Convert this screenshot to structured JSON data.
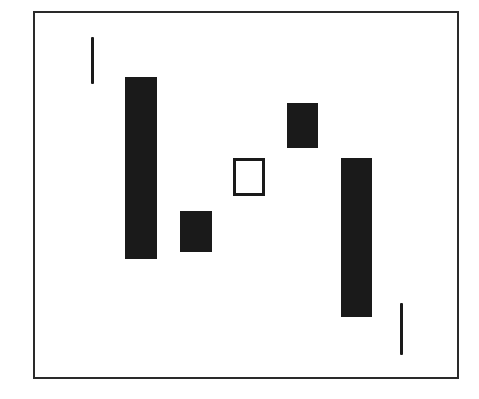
{
  "diagram": {
    "type": "candlestick-pattern",
    "frame": {
      "left": 33,
      "top": 11,
      "width": 426,
      "height": 368,
      "border_color": "#2a2a2a"
    },
    "colors": {
      "filled": "#1a1a1a",
      "hollow_fill": "#ffffff",
      "stroke": "#1a1a1a"
    },
    "elements": [
      {
        "id": "line-1",
        "kind": "line",
        "left": 91,
        "top": 37,
        "width": 3,
        "height": 47
      },
      {
        "id": "bar-1",
        "kind": "filled",
        "left": 125,
        "top": 77,
        "width": 32,
        "height": 182
      },
      {
        "id": "bar-2",
        "kind": "filled",
        "left": 180,
        "top": 211,
        "width": 32,
        "height": 41
      },
      {
        "id": "box-3",
        "kind": "hollow",
        "left": 233,
        "top": 158,
        "width": 32,
        "height": 38
      },
      {
        "id": "bar-4",
        "kind": "filled",
        "left": 287,
        "top": 103,
        "width": 31,
        "height": 45
      },
      {
        "id": "bar-5",
        "kind": "filled",
        "left": 341,
        "top": 158,
        "width": 31,
        "height": 159
      },
      {
        "id": "line-2",
        "kind": "line",
        "left": 400,
        "top": 303,
        "width": 3,
        "height": 52
      }
    ]
  }
}
